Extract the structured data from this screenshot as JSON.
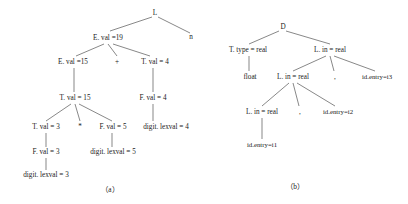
{
  "figure": {
    "background_color": "#ffffff",
    "edge_color": "#555555",
    "text_color": "#1b1b1b",
    "captions": {
      "a": "（a）",
      "b": "（b）"
    }
  },
  "tree_a": {
    "caption": "（a）",
    "nodes": {
      "root": "L",
      "n_terminal": "n",
      "e_val_19": "E. val =19",
      "e_val_15": "E. val =15",
      "plus": "+",
      "t_val_4": "T. val = 4",
      "t_val_15": "T. val = 15",
      "f_val_4": "F. val = 4",
      "t_val_3": "T. val = 3",
      "star": "*",
      "f_val_5": "F. val = 5",
      "digit_lexval_4": "digit. lexval = 4",
      "f_val_3": "F. val = 3",
      "digit_lexval_5": "digit. lexval = 5",
      "digit_lexval_3": "digit. lexval = 3"
    }
  },
  "tree_b": {
    "caption": "（b）",
    "nodes": {
      "root": "D",
      "t_type_real": "T. type = real",
      "l_in_real_1": "L. in = real",
      "float": "float",
      "l_in_real_2": "L. in = real",
      "comma_1": ",",
      "id_entry_i3": "id.entry=i3",
      "l_in_real_3": "L. in = real",
      "comma_2": ",",
      "id_entry_i2": "id.entry=i2",
      "id_entry_i1": "id.entry=i1"
    }
  }
}
